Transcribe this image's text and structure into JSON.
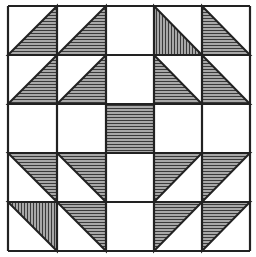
{
  "grid": {
    "rows": 5,
    "cols": 5,
    "x_lines": [
      8,
      57,
      106,
      154,
      202,
      250
    ],
    "y_lines": [
      6,
      55,
      104,
      153,
      202,
      251
    ]
  },
  "colors": {
    "background": "#ffffff",
    "line": "#222222",
    "shade": "#9a9a9a",
    "hatch": "#3a3a3a"
  },
  "cells": [
    {
      "row": 0,
      "col": 0,
      "shape": "br",
      "hatch": "h"
    },
    {
      "row": 0,
      "col": 1,
      "shape": "br",
      "hatch": "h"
    },
    {
      "row": 0,
      "col": 2,
      "shape": "none"
    },
    {
      "row": 0,
      "col": 3,
      "shape": "bl",
      "hatch": "v"
    },
    {
      "row": 0,
      "col": 4,
      "shape": "bl",
      "hatch": "h"
    },
    {
      "row": 1,
      "col": 0,
      "shape": "br",
      "hatch": "h"
    },
    {
      "row": 1,
      "col": 1,
      "shape": "br",
      "hatch": "h"
    },
    {
      "row": 1,
      "col": 2,
      "shape": "none"
    },
    {
      "row": 1,
      "col": 3,
      "shape": "bl",
      "hatch": "h"
    },
    {
      "row": 1,
      "col": 4,
      "shape": "bl",
      "hatch": "h"
    },
    {
      "row": 2,
      "col": 0,
      "shape": "none"
    },
    {
      "row": 2,
      "col": 1,
      "shape": "none"
    },
    {
      "row": 2,
      "col": 2,
      "shape": "full",
      "hatch": "h"
    },
    {
      "row": 2,
      "col": 3,
      "shape": "none"
    },
    {
      "row": 2,
      "col": 4,
      "shape": "none"
    },
    {
      "row": 3,
      "col": 0,
      "shape": "tr",
      "hatch": "h"
    },
    {
      "row": 3,
      "col": 1,
      "shape": "tr",
      "hatch": "h"
    },
    {
      "row": 3,
      "col": 2,
      "shape": "none"
    },
    {
      "row": 3,
      "col": 3,
      "shape": "tl",
      "hatch": "h"
    },
    {
      "row": 3,
      "col": 4,
      "shape": "tl",
      "hatch": "h"
    },
    {
      "row": 4,
      "col": 0,
      "shape": "tr",
      "hatch": "v"
    },
    {
      "row": 4,
      "col": 1,
      "shape": "tr",
      "hatch": "h"
    },
    {
      "row": 4,
      "col": 2,
      "shape": "none"
    },
    {
      "row": 4,
      "col": 3,
      "shape": "tl",
      "hatch": "h"
    },
    {
      "row": 4,
      "col": 4,
      "shape": "tl",
      "hatch": "h"
    }
  ]
}
